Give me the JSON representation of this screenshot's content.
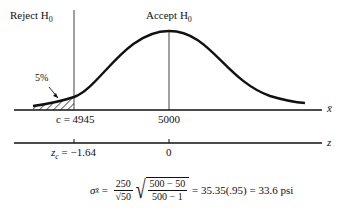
{
  "diagram": {
    "type": "hypothesis-test-normal-curve",
    "labels": {
      "reject": "Reject H",
      "reject_sub": "0",
      "accept": "Accept H",
      "accept_sub": "0",
      "tail_pct": "5%",
      "c_value": "c = 4945",
      "mean_value": "5000",
      "xbar_axis": "x̄",
      "zc_value": "z",
      "zc_sub": "c",
      "zc_rest": " = −1.64",
      "z_zero": "0",
      "z_axis": "z"
    },
    "formula": {
      "lhs": "σ",
      "lhs_sub": "x̄",
      "eq": " = ",
      "frac1_num": "250",
      "frac1_den": "√50",
      "frac2_num": "500 − 50",
      "frac2_den": "500 − 1",
      "rhs": " = 35.35(.95) = 33.6 psi"
    }
  }
}
